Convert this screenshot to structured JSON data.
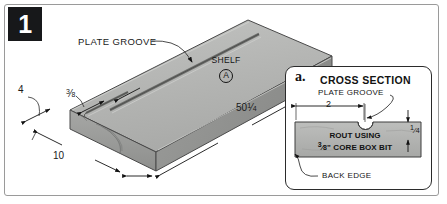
{
  "figure": {
    "step_number": "1",
    "main": {
      "plate_groove_label": "PLATE GROOVE",
      "shelf_label": "SHELF",
      "shelf_key": "A",
      "dim_thickness": "4",
      "dim_groove_offset_whole": "",
      "dim_groove_offset_num": "3",
      "dim_groove_offset_den": "8",
      "dim_length_whole": "50",
      "dim_length_num": "1",
      "dim_length_den": "4",
      "dim_width": "10"
    },
    "inset": {
      "letter": "a.",
      "title": "CROSS SECTION",
      "plate_groove_label": "PLATE GROOVE",
      "dim_two": "2",
      "dim_quarter_num": "1",
      "dim_quarter_den": "4",
      "rout_line1": "ROUT USING",
      "rout_line2_num": "3",
      "rout_line2_den": "8",
      "rout_line2_rest": "\" CORE BOX BIT",
      "back_edge_label": "BACK EDGE"
    },
    "colors": {
      "badge_bg": "#17181a",
      "board_top": "#b6b7b5",
      "board_front": "#9d9e9c",
      "board_end": "#8f908e",
      "frame_border": "#9a9a9a",
      "ink": "#1a1a1a"
    }
  }
}
